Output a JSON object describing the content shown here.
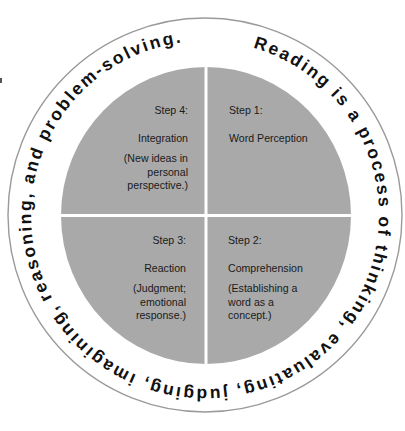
{
  "ring_text": "Reading is a process of thinking, evaluating, judging, imagining, reasoning, and problem-solving.",
  "colors": {
    "quadrant_fill": "#a9a9a9",
    "divider": "#ffffff",
    "outer_ring_stroke": "#9a9a9a",
    "text": "#111111"
  },
  "quadrants": [
    {
      "position": "top-right",
      "step": "Step 1:",
      "name": "Word Perception",
      "description": []
    },
    {
      "position": "bottom-right",
      "step": "Step 2:",
      "name": "Comprehension",
      "description": [
        "(Establishing a",
        "word as a",
        "concept.)"
      ]
    },
    {
      "position": "bottom-left",
      "step": "Step 3:",
      "name": "Reaction",
      "description": [
        "(Judgment;",
        "emotional",
        "response.)"
      ]
    },
    {
      "position": "top-left",
      "step": "Step 4:",
      "name": "Integration",
      "description": [
        "(New ideas in",
        "personal",
        "perspective.)"
      ]
    }
  ]
}
